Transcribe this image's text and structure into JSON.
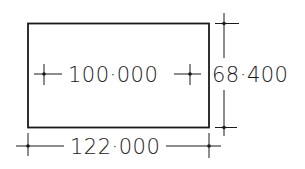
{
  "drawing": {
    "rectangle": {
      "stroke_color": "#1a1a1a"
    },
    "dimensions": {
      "inner_width": {
        "label": "100·000"
      },
      "overall_height": {
        "label": "68·400"
      },
      "overall_width": {
        "label": "122·000"
      }
    }
  }
}
